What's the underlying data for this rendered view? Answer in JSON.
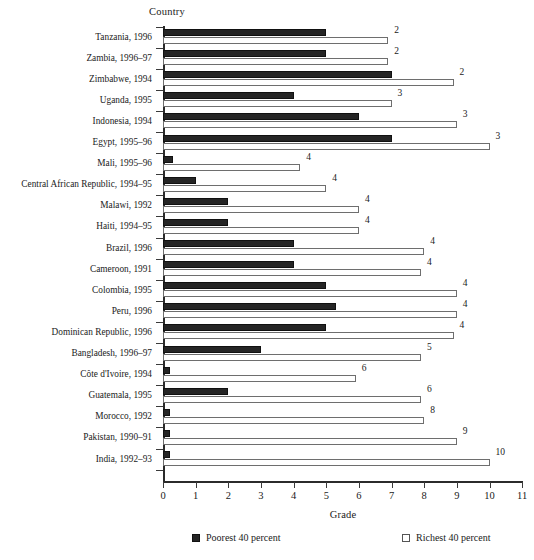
{
  "chart_data": {
    "type": "bar",
    "orientation": "horizontal",
    "title": "",
    "xlabel": "Grade",
    "ylabel": "Country",
    "xlim": [
      0,
      11
    ],
    "xticks": [
      0,
      1,
      2,
      3,
      4,
      5,
      6,
      7,
      8,
      9,
      10,
      11
    ],
    "xtick_labels": [
      "0",
      "1",
      "2",
      "3",
      "4",
      "5",
      "6",
      "7",
      "8",
      "9",
      "10",
      "11"
    ],
    "grid": false,
    "legend_position": "bottom",
    "legend": [
      {
        "name": "Poorest 40 percent",
        "swatch": "filled-black"
      },
      {
        "name": "Richest 40 percent",
        "swatch": "open-white"
      }
    ],
    "series": [
      {
        "name": "Poorest 40 percent",
        "key": "poorest"
      },
      {
        "name": "Richest 40 percent",
        "key": "richest"
      }
    ],
    "categories": [
      "Tanzania, 1996",
      "Zambia, 1996–97",
      "Zimbabwe, 1994",
      "Uganda, 1995",
      "Indonesia, 1994",
      "Egypt, 1995–96",
      "Mali, 1995–96",
      "Central African Republic, 1994–95",
      "Malawi, 1992",
      "Haiti, 1994–95",
      "Brazil, 1996",
      "Cameroon, 1991",
      "Colombia, 1995",
      "Peru, 1996",
      "Dominican Republic, 1996",
      "Bangladesh, 1996–97",
      "Côte d'Ivoire, 1994",
      "Guatemala, 1995",
      "Morocco, 1992",
      "Pakistan, 1990–91",
      "India, 1992–93"
    ],
    "rows": [
      {
        "category": "Tanzania, 1996",
        "poorest": 5.0,
        "richest": 6.9,
        "value_label": "2"
      },
      {
        "category": "Zambia, 1996–97",
        "poorest": 5.0,
        "richest": 6.9,
        "value_label": "2"
      },
      {
        "category": "Zimbabwe, 1994",
        "poorest": 7.0,
        "richest": 8.9,
        "value_label": "2"
      },
      {
        "category": "Uganda, 1995",
        "poorest": 4.0,
        "richest": 7.0,
        "value_label": "3"
      },
      {
        "category": "Indonesia, 1994",
        "poorest": 6.0,
        "richest": 9.0,
        "value_label": "3"
      },
      {
        "category": "Egypt, 1995–96",
        "poorest": 7.0,
        "richest": 10.0,
        "value_label": "3"
      },
      {
        "category": "Mali, 1995–96",
        "poorest": 0.3,
        "richest": 4.2,
        "value_label": "4"
      },
      {
        "category": "Central African Republic, 1994–95",
        "poorest": 1.0,
        "richest": 5.0,
        "value_label": "4"
      },
      {
        "category": "Malawi, 1992",
        "poorest": 2.0,
        "richest": 6.0,
        "value_label": "4"
      },
      {
        "category": "Haiti, 1994–95",
        "poorest": 2.0,
        "richest": 6.0,
        "value_label": "4"
      },
      {
        "category": "Brazil, 1996",
        "poorest": 4.0,
        "richest": 8.0,
        "value_label": "4"
      },
      {
        "category": "Cameroon, 1991",
        "poorest": 4.0,
        "richest": 7.9,
        "value_label": "4"
      },
      {
        "category": "Colombia, 1995",
        "poorest": 5.0,
        "richest": 9.0,
        "value_label": "4"
      },
      {
        "category": "Peru, 1996",
        "poorest": 5.3,
        "richest": 9.0,
        "value_label": "4"
      },
      {
        "category": "Dominican Republic, 1996",
        "poorest": 5.0,
        "richest": 8.9,
        "value_label": "4"
      },
      {
        "category": "Bangladesh, 1996–97",
        "poorest": 3.0,
        "richest": 7.9,
        "value_label": "5"
      },
      {
        "category": "Côte d'Ivoire, 1994",
        "poorest": 0.2,
        "richest": 5.9,
        "value_label": "6"
      },
      {
        "category": "Guatemala, 1995",
        "poorest": 2.0,
        "richest": 7.9,
        "value_label": "6"
      },
      {
        "category": "Morocco, 1992",
        "poorest": 0.2,
        "richest": 8.0,
        "value_label": "8"
      },
      {
        "category": "Pakistan, 1990–91",
        "poorest": 0.2,
        "richest": 9.0,
        "value_label": "9"
      },
      {
        "category": "India, 1992–93",
        "poorest": 0.2,
        "richest": 10.0,
        "value_label": "10"
      }
    ],
    "colors": {
      "poorest": "#252525",
      "richest": "#ffffff",
      "richest_border": "#6e6e6e",
      "axis": "#2b2b2b",
      "text": "#1a1a1a"
    }
  }
}
